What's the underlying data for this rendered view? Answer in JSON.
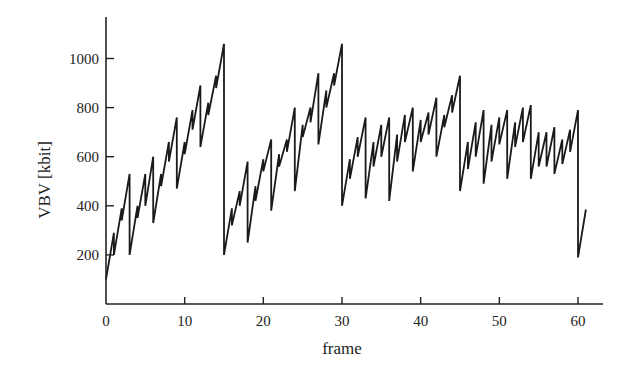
{
  "chart_data": {
    "type": "line",
    "title": "",
    "xlabel": "frame",
    "ylabel": "VBV [kbit]",
    "xlim": [
      0,
      62
    ],
    "ylim": [
      0,
      1150
    ],
    "xticks": [
      0,
      10,
      20,
      30,
      40,
      50,
      60
    ],
    "yticks": [
      200,
      400,
      600,
      800,
      1000
    ],
    "grid": false,
    "legend": null,
    "series": [
      {
        "name": "VBV occupancy",
        "description": "Sawtooth: buffer fills linearly between frames, drops vertically at each frame boundary by the coded picture size. Large drops at I-frames (0,15,30,45,60).",
        "points": [
          [
            0,
            100
          ],
          [
            1,
            290
          ],
          [
            1,
            200
          ],
          [
            2,
            390
          ],
          [
            2,
            340
          ],
          [
            3,
            530
          ],
          [
            3,
            200
          ],
          [
            4,
            400
          ],
          [
            4,
            350
          ],
          [
            5,
            530
          ],
          [
            5,
            400
          ],
          [
            6,
            600
          ],
          [
            6,
            330
          ],
          [
            7,
            530
          ],
          [
            7,
            480
          ],
          [
            8,
            660
          ],
          [
            8,
            580
          ],
          [
            9,
            760
          ],
          [
            9,
            470
          ],
          [
            10,
            660
          ],
          [
            10,
            610
          ],
          [
            11,
            790
          ],
          [
            11,
            710
          ],
          [
            12,
            890
          ],
          [
            12,
            640
          ],
          [
            13,
            820
          ],
          [
            13,
            770
          ],
          [
            14,
            930
          ],
          [
            14,
            880
          ],
          [
            15,
            1060
          ],
          [
            15,
            200
          ],
          [
            16,
            390
          ],
          [
            16,
            320
          ],
          [
            17,
            460
          ],
          [
            17,
            400
          ],
          [
            18,
            580
          ],
          [
            18,
            250
          ],
          [
            19,
            480
          ],
          [
            19,
            420
          ],
          [
            20,
            590
          ],
          [
            20,
            540
          ],
          [
            21,
            670
          ],
          [
            21,
            380
          ],
          [
            22,
            610
          ],
          [
            22,
            560
          ],
          [
            23,
            670
          ],
          [
            23,
            620
          ],
          [
            24,
            800
          ],
          [
            24,
            460
          ],
          [
            25,
            730
          ],
          [
            25,
            680
          ],
          [
            26,
            800
          ],
          [
            26,
            740
          ],
          [
            27,
            940
          ],
          [
            27,
            650
          ],
          [
            28,
            870
          ],
          [
            28,
            800
          ],
          [
            29,
            940
          ],
          [
            29,
            890
          ],
          [
            30,
            1060
          ],
          [
            30,
            400
          ],
          [
            31,
            590
          ],
          [
            31,
            510
          ],
          [
            32,
            680
          ],
          [
            32,
            600
          ],
          [
            33,
            760
          ],
          [
            33,
            430
          ],
          [
            34,
            660
          ],
          [
            34,
            560
          ],
          [
            35,
            730
          ],
          [
            35,
            600
          ],
          [
            36,
            760
          ],
          [
            36,
            420
          ],
          [
            37,
            690
          ],
          [
            37,
            580
          ],
          [
            38,
            770
          ],
          [
            38,
            660
          ],
          [
            39,
            800
          ],
          [
            39,
            540
          ],
          [
            40,
            750
          ],
          [
            40,
            660
          ],
          [
            41,
            780
          ],
          [
            41,
            690
          ],
          [
            42,
            840
          ],
          [
            42,
            600
          ],
          [
            43,
            770
          ],
          [
            43,
            720
          ],
          [
            44,
            850
          ],
          [
            44,
            780
          ],
          [
            45,
            930
          ],
          [
            45,
            460
          ],
          [
            46,
            660
          ],
          [
            46,
            550
          ],
          [
            47,
            740
          ],
          [
            47,
            600
          ],
          [
            48,
            790
          ],
          [
            48,
            490
          ],
          [
            49,
            730
          ],
          [
            49,
            580
          ],
          [
            50,
            760
          ],
          [
            50,
            650
          ],
          [
            51,
            790
          ],
          [
            51,
            510
          ],
          [
            52,
            740
          ],
          [
            52,
            640
          ],
          [
            53,
            800
          ],
          [
            53,
            660
          ],
          [
            54,
            810
          ],
          [
            54,
            510
          ],
          [
            55,
            700
          ],
          [
            55,
            560
          ],
          [
            56,
            700
          ],
          [
            56,
            560
          ],
          [
            57,
            720
          ],
          [
            57,
            530
          ],
          [
            58,
            670
          ],
          [
            58,
            570
          ],
          [
            59,
            710
          ],
          [
            59,
            620
          ],
          [
            60,
            790
          ],
          [
            60,
            190
          ],
          [
            61,
            385
          ]
        ]
      }
    ]
  },
  "axes": {
    "x_label": "frame",
    "y_label": "VBV [kbit]",
    "x_tick_labels": [
      "0",
      "10",
      "20",
      "30",
      "40",
      "50",
      "60"
    ],
    "y_tick_labels": [
      "200",
      "400",
      "600",
      "800",
      "1000"
    ]
  }
}
